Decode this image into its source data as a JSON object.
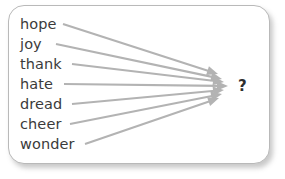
{
  "canvas": {
    "width": 285,
    "height": 179,
    "background": "#ffffff"
  },
  "card": {
    "border_color": "#b9b9b9",
    "background": "#ffffff",
    "corner_radius": 16,
    "shadow_color": "rgba(120,120,120,0.40)"
  },
  "diagram": {
    "type": "convergence-fan",
    "arrow_color": "#b3b3b3",
    "text_color": "#3b3b3b",
    "convergence_x": 222,
    "words": [
      {
        "label": "hope",
        "y": 24,
        "line_start_x": 63,
        "tip_x": 218,
        "tip_y": 74
      },
      {
        "label": "joy",
        "y": 44,
        "line_start_x": 56,
        "tip_x": 222,
        "tip_y": 79
      },
      {
        "label": "thank",
        "y": 64,
        "line_start_x": 72,
        "tip_x": 224,
        "tip_y": 82
      },
      {
        "label": "hate",
        "y": 84,
        "line_start_x": 64,
        "tip_x": 228,
        "tip_y": 86
      },
      {
        "label": "dread",
        "y": 104,
        "line_start_x": 72,
        "tip_x": 224,
        "tip_y": 90
      },
      {
        "label": "cheer",
        "y": 124,
        "line_start_x": 70,
        "tip_x": 222,
        "tip_y": 94
      },
      {
        "label": "wonder",
        "y": 144,
        "line_start_x": 85,
        "tip_x": 219,
        "tip_y": 98
      }
    ],
    "target": {
      "label": "?",
      "x": 238,
      "y": 79
    }
  }
}
